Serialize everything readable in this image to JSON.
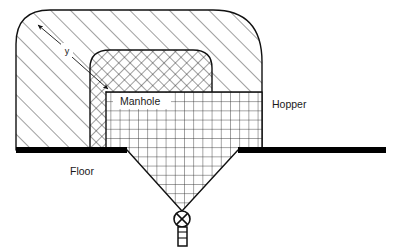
{
  "diagram": {
    "background_color": "#ffffff",
    "line_color": "#111111",
    "floor_color": "#000000",
    "labels": {
      "hopper": "Hopper",
      "manhole": "Manhole",
      "floor": "Floor",
      "dimension_y": "y"
    },
    "label_positions": {
      "hopper": {
        "x": 272,
        "y": 108
      },
      "manhole": {
        "x": 120,
        "y": 103
      },
      "floor": {
        "x": 70,
        "y": 175
      },
      "dimension_y": {
        "x": 67,
        "y": 51
      }
    },
    "icons": {
      "valve": "valve-circle-x-icon",
      "outlet": "outlet-pipe-icon",
      "dimension_arrow": "double-headed-arrow-icon"
    },
    "parts": [
      {
        "name": "hopper-body",
        "fill_pattern": "diagonal-hatch"
      },
      {
        "name": "manhole-wall",
        "fill_pattern": "cross-hatch"
      },
      {
        "name": "hopper-interior",
        "fill_pattern": "square-grid"
      },
      {
        "name": "floor-slab",
        "fill_pattern": "solid"
      },
      {
        "name": "discharge-valve",
        "fill_pattern": "outline"
      },
      {
        "name": "discharge-pipe",
        "fill_pattern": "outline"
      }
    ],
    "geometry": {
      "floor_y": 150,
      "floor_left_x": 16,
      "floor_right_x": 386,
      "opening_left_x": 127,
      "opening_right_x": 238,
      "valve_center": {
        "x": 182,
        "y": 219
      },
      "valve_radius": 8
    }
  }
}
